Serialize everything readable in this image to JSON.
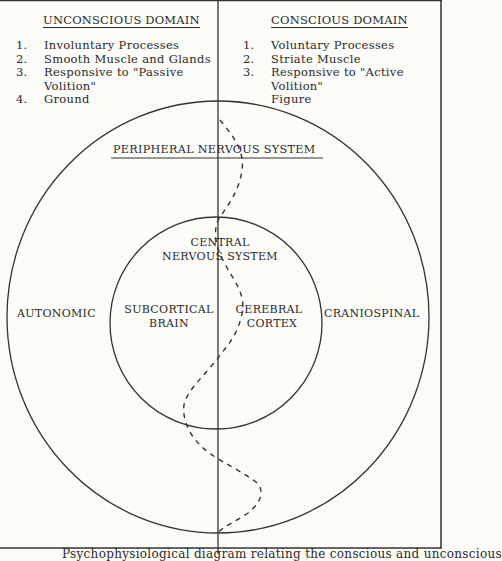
{
  "left_domain": {
    "heading": "UNCONSCIOUS DOMAIN",
    "items": [
      {
        "num": "1.",
        "text": "Involuntary Processes"
      },
      {
        "num": "2.",
        "text": "Smooth Muscle and Glands"
      },
      {
        "num": "3.",
        "text": "Responsive to \"Passive"
      },
      {
        "num": "",
        "text": "Volition\""
      },
      {
        "num": "4.",
        "text": "Ground"
      }
    ]
  },
  "right_domain": {
    "heading": "CONSCIOUS DOMAIN",
    "items": [
      {
        "num": "1.",
        "text": "Voluntary Processes"
      },
      {
        "num": "2.",
        "text": "Striate Muscle"
      },
      {
        "num": "3.",
        "text": "Responsive to \"Active"
      },
      {
        "num": "",
        "text": "Volition\""
      },
      {
        "num": "",
        "text": "Figure"
      }
    ]
  },
  "diagram": {
    "peripheral_label": "PERIPHERAL NERVOUS SYSTEM",
    "central_label_line1": "CENTRAL",
    "central_label_line2": "NERVOUS SYSTEM",
    "subcortical_line1": "SUBCORTICAL",
    "subcortical_line2": "BRAIN",
    "cerebral_line1": "CEREBRAL",
    "cerebral_line2": "CORTEX",
    "left_side_label": "AUTONOMIC",
    "right_side_label": "CRANIOSPINAL"
  },
  "caption": "Psychophysiological diagram relating the conscious and unconscious"
}
